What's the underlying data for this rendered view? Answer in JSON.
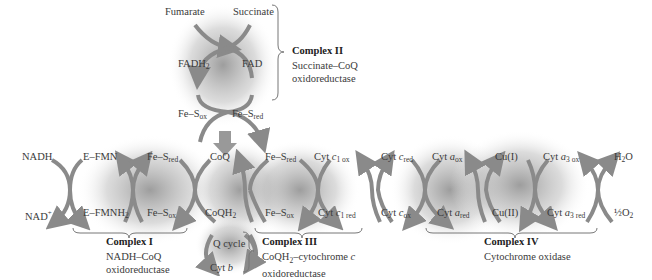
{
  "complex2": {
    "title": "Complex II",
    "desc1": "Succinate–CoQ",
    "desc2": "oxidoreductase",
    "fumarate": "Fumarate",
    "succinate": "Succinate",
    "fadh2": "FADH",
    "fadh2_sub": "2",
    "fad": "FAD",
    "fes": "Fe–S",
    "ox": "ox",
    "red": "red"
  },
  "complex1": {
    "title": "Complex I",
    "desc1": "NADH–CoQ",
    "desc2": "oxidoreductase",
    "nadh": "NADH",
    "nad": "NAD",
    "nad_sup": "+",
    "efmn": "E–FMN",
    "efmnh2": "E–FMNH",
    "sub2": "2",
    "fes": "Fe–S",
    "ox": "ox",
    "red": "red"
  },
  "complex3": {
    "title": "Complex III",
    "desc1a": "CoQH",
    "desc1b": "–cytochrome ",
    "desc1c": "c",
    "desc2": "oxidoreductase",
    "coq": "CoQ",
    "coqh2": "CoQH",
    "qcycle": "Q cycle",
    "cytb_a": "Cyt ",
    "cytb_b": "b",
    "fes": "Fe–S",
    "cyt": "Cyt ",
    "c": "c",
    "c1ox": "1 ox",
    "c1red": "1 red",
    "ox": "ox",
    "red": "red",
    "sub2": "2"
  },
  "cytc": {
    "cyt": "Cyt ",
    "c": "c",
    "red": "red",
    "ox": "ox"
  },
  "complex4": {
    "title": "Complex IV",
    "desc": "Cytochrome oxidase",
    "cyt": "Cyt ",
    "a": "a",
    "ox": "ox",
    "red": "red",
    "a3ox": "3 ox",
    "a3red": "3 red",
    "cu1": "Cu(I)",
    "cu2": "Cu(II)",
    "h2o_a": "H",
    "h2o_b": "2",
    "h2o_c": "O",
    "half_o2_a": "½",
    "half_o2_b": "O",
    "half_o2_c": "2"
  },
  "colors": {
    "arrow": "#8a8a8a",
    "shade": "#9a9a9a",
    "text": "#3a3a3a",
    "brace": "#777777"
  }
}
